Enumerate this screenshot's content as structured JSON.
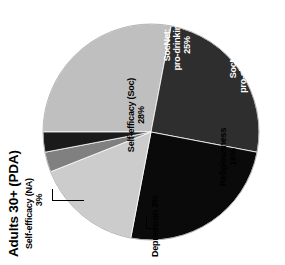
{
  "chart_data": {
    "type": "pie",
    "title": "Adults 30+ (PDA)",
    "xlabel": "",
    "ylabel": "",
    "legend_position": "none",
    "grid": false,
    "rotation_deg": -90,
    "note": "Labels are drawn on/next to their slices; text reads bottom-to-top.",
    "categories": [
      "Self-efficacy (Soc)",
      "SocNet: pro-drinking",
      "SocNet: pro-abstinence",
      "Religiousness",
      "Depression",
      "Self-efficacy (NA)"
    ],
    "values": [
      28,
      25,
      25,
      16,
      3,
      3
    ],
    "colors": [
      "#bfbfbf",
      "#2e2e2e",
      "#0a0a0a",
      "#cccccc",
      "#808080",
      "#1a1a1a"
    ],
    "slices": [
      {
        "name": "Self-efficacy (Soc)",
        "label_line1": "Self-efficacy (Soc)",
        "label_line2": "28%",
        "value": 28,
        "percent_text": "28%",
        "color": "#bfbfbf",
        "start_deg": 0,
        "end_deg": 100.8,
        "label_placement": "inside"
      },
      {
        "name": "SocNet: pro-drinking",
        "label_line1": "SocNet:",
        "label_line2": "pro-drinking",
        "label_line3": "25%",
        "value": 25,
        "percent_text": "25%",
        "color": "#2e2e2e",
        "start_deg": 100.8,
        "end_deg": 190.8,
        "label_placement": "inside"
      },
      {
        "name": "SocNet: pro-abstinence",
        "label_line1": "SocNet:",
        "label_line2": "pro-abstinence",
        "label_line3": "25%",
        "value": 25,
        "percent_text": "25%",
        "color": "#0a0a0a",
        "start_deg": 190.8,
        "end_deg": 280.8,
        "label_placement": "inside"
      },
      {
        "name": "Religiousness",
        "label_line1": "Religiousness",
        "label_line2": "16%",
        "value": 16,
        "percent_text": "16%",
        "color": "#cccccc",
        "start_deg": 280.8,
        "end_deg": 338.4,
        "label_placement": "inside"
      },
      {
        "name": "Depression",
        "label_line1": "Depression 3%",
        "value": 3,
        "percent_text": "3%",
        "color": "#808080",
        "start_deg": 338.4,
        "end_deg": 349.2,
        "label_placement": "callout"
      },
      {
        "name": "Self-efficacy (NA)",
        "label_line1": "Self-efficacy (NA)",
        "label_line2": "3%",
        "value": 3,
        "percent_text": "3%",
        "color": "#1a1a1a",
        "start_deg": 349.2,
        "end_deg": 360,
        "label_placement": "callout"
      }
    ]
  },
  "title": {
    "text": "Adults 30+ (PDA)"
  },
  "labels": {
    "self_efficacy_soc": {
      "line1": "Self-efficacy (Soc)",
      "line2": "28%"
    },
    "socnet_prodrinking": {
      "line1": "SocNet:",
      "line2": "pro-drinking",
      "line3": "25%"
    },
    "socnet_proabstinence": {
      "line1": "SocNet:",
      "line2": "pro-abstinence",
      "line3": "25%"
    },
    "religiousness": {
      "line1": "Religiousness",
      "line2": "16%"
    },
    "depression": {
      "line1": "Depression 3%"
    },
    "self_efficacy_na": {
      "line1": "Self-efficacy (NA)",
      "line2": "3%"
    }
  }
}
